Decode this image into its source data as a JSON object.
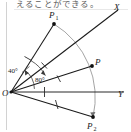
{
  "figure": {
    "caption": "えることができる。",
    "type": "geometry-diagram",
    "colors": {
      "line": "#1a1a1a",
      "arc": "#8a8a8a",
      "axis": "#2b2b2b",
      "background": "#ffffff",
      "caption": "#5e5e5e"
    },
    "vertex_label": "O",
    "labels": {
      "origin": "O",
      "ray_x": "X",
      "ray_y": "Y",
      "point_p": "P",
      "point_p1_base": "P",
      "point_p1_sub": "1",
      "point_p2_base": "P",
      "point_p2_sub": "2",
      "angle_40": "40°",
      "angle_80": "80°"
    },
    "geometry": {
      "origin": {
        "x": 11,
        "y": 92
      },
      "ray_x_end": {
        "x": 118,
        "y": 10
      },
      "ray_y_end": {
        "x": 124,
        "y": 92
      },
      "point_p1": {
        "x": 54,
        "y": 24
      },
      "point_p": {
        "x": 92,
        "y": 66
      },
      "point_p2": {
        "x": 93,
        "y": 117
      },
      "arc_radius": 86,
      "angle_40_deg": 40,
      "angle_80_deg": 80
    },
    "tick_marks": [
      {
        "on": "OP1",
        "count": 1
      },
      {
        "on": "OX",
        "count": 1
      },
      {
        "on": "OP",
        "count": 1
      },
      {
        "on": "OY",
        "count": 1
      },
      {
        "on": "OP2",
        "count": 1
      }
    ]
  }
}
